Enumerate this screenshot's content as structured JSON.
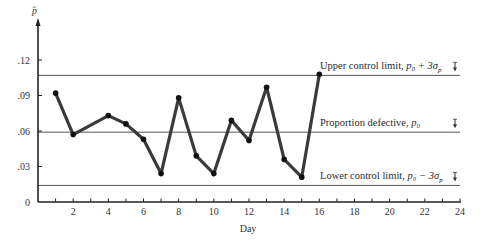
{
  "chart_data": {
    "type": "line",
    "title": "",
    "xlabel": "Day",
    "ylabel": "p̂",
    "xlim": [
      0,
      24
    ],
    "ylim": [
      0,
      0.13
    ],
    "x_ticks": [
      2,
      4,
      6,
      8,
      10,
      12,
      14,
      16,
      18,
      20,
      22,
      24
    ],
    "x_tick_labels": [
      "2",
      "4",
      "6",
      "8",
      "10",
      "12",
      "14",
      "16",
      "18",
      "20",
      "22",
      "24"
    ],
    "y_ticks": [
      0,
      0.03,
      0.06,
      0.09,
      0.12
    ],
    "y_tick_labels": [
      "0",
      ".03",
      ".06",
      ".09",
      ".12"
    ],
    "grid": false,
    "series": [
      {
        "name": "Sample proportion defective",
        "x": [
          1,
          2,
          4,
          5,
          6,
          7,
          8,
          9,
          10,
          11,
          12,
          13,
          14,
          15,
          16
        ],
        "values": [
          0.092,
          0.057,
          0.073,
          0.066,
          0.053,
          0.024,
          0.088,
          0.039,
          0.024,
          0.069,
          0.052,
          0.097,
          0.036,
          0.021,
          0.108
        ]
      }
    ],
    "reference_lines": [
      {
        "name": "upper-control-limit",
        "value": 0.107,
        "label_prefix": "Upper control limit, ",
        "label_math": "p₀ + 3σ",
        "label_sub": "p̂"
      },
      {
        "name": "center-line",
        "value": 0.059,
        "label_prefix": "Proportion defective, ",
        "label_math": "p₀",
        "label_sub": ""
      },
      {
        "name": "lower-control-limit",
        "value": 0.014,
        "label_prefix": "Lower control limit, ",
        "label_math": "p₀ − 3σ",
        "label_sub": "p̂"
      }
    ],
    "colors": {
      "series": "#3a3a3a",
      "reference": "#555555",
      "axis": "#222222"
    }
  }
}
